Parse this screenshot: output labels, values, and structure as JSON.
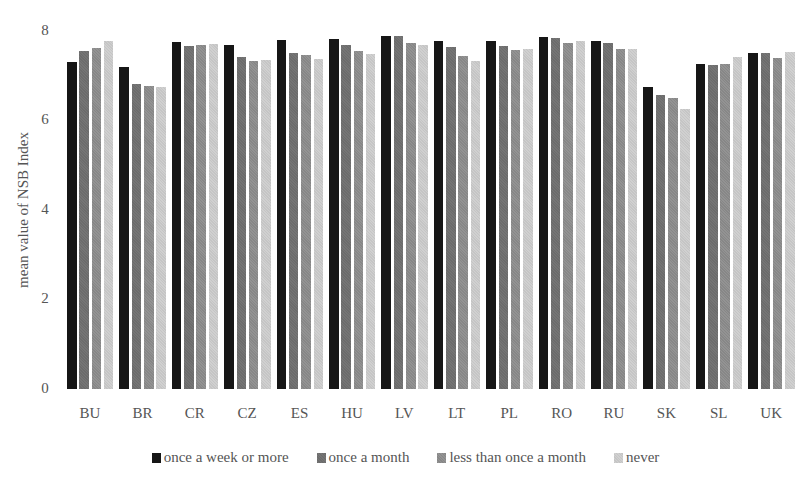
{
  "chart_data": {
    "type": "bar",
    "title": "",
    "xlabel": "",
    "ylabel": "mean value of NSB Index",
    "ylim": [
      0,
      8
    ],
    "yticks": [
      0,
      2,
      4,
      6,
      8
    ],
    "grid": false,
    "legend_position": "bottom",
    "categories": [
      "BU",
      "BR",
      "CR",
      "CZ",
      "ES",
      "HU",
      "LV",
      "LT",
      "PL",
      "RO",
      "RU",
      "SK",
      "SL",
      "UK"
    ],
    "series": [
      {
        "name": "once a week or more",
        "color": "#161616",
        "values": [
          7.3,
          7.19,
          7.75,
          7.68,
          7.79,
          7.81,
          7.88,
          7.77,
          7.77,
          7.86,
          7.77,
          6.74,
          7.25,
          7.5
        ]
      },
      {
        "name": "once a month",
        "color": "#6c6c6c",
        "values": [
          7.54,
          6.8,
          7.66,
          7.41,
          7.5,
          7.68,
          7.88,
          7.63,
          7.66,
          7.83,
          7.72,
          6.56,
          7.23,
          7.5
        ]
      },
      {
        "name": "less than once a month",
        "color": "#878787",
        "values": [
          7.61,
          6.76,
          7.68,
          7.32,
          7.46,
          7.54,
          7.72,
          7.43,
          7.57,
          7.72,
          7.59,
          6.5,
          7.25,
          7.39
        ]
      },
      {
        "name": "never",
        "color": "#c5c5c5",
        "values": [
          7.77,
          6.74,
          7.7,
          7.34,
          7.37,
          7.48,
          7.68,
          7.32,
          7.59,
          7.77,
          7.59,
          6.25,
          7.41,
          7.52
        ]
      }
    ]
  }
}
